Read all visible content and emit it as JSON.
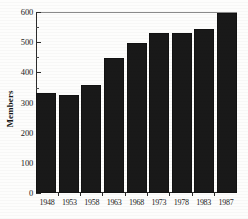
{
  "chart_data": {
    "type": "bar",
    "title": "",
    "xlabel": "",
    "ylabel": "Members",
    "categories": [
      "1948",
      "1953",
      "1958",
      "1963",
      "1968",
      "1973",
      "1978",
      "1983",
      "1987"
    ],
    "values": [
      331,
      325,
      358,
      448,
      498,
      532,
      532,
      543,
      598
    ],
    "ylim": [
      0,
      600
    ],
    "yticks": [
      0,
      100,
      200,
      300,
      400,
      500,
      600
    ],
    "ytick_labels": [
      "0",
      "100",
      "200",
      "300",
      "400",
      "500",
      "600"
    ],
    "yminor_ticks": [
      50,
      150,
      250,
      350,
      450,
      550
    ],
    "grid": false,
    "legend": null,
    "bar_color": "#191919",
    "axis_color": "#2b2b2b",
    "background_color": "#fdfdfc"
  }
}
